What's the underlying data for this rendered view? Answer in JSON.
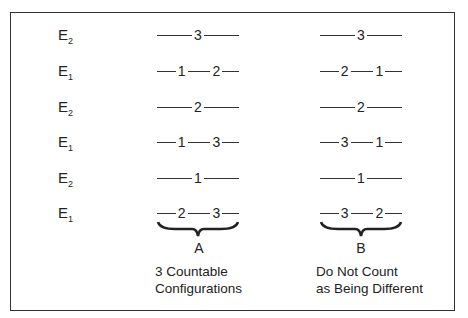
{
  "rows": [
    {
      "label": "E",
      "sub": "2",
      "a": [
        "3"
      ],
      "b": [
        "3"
      ]
    },
    {
      "label": "E",
      "sub": "1",
      "a": [
        "1",
        "2"
      ],
      "b": [
        "2",
        "1"
      ]
    },
    {
      "label": "E",
      "sub": "2",
      "a": [
        "2"
      ],
      "b": [
        "2"
      ]
    },
    {
      "label": "E",
      "sub": "1",
      "a": [
        "1",
        "3"
      ],
      "b": [
        "3",
        "1"
      ]
    },
    {
      "label": "E",
      "sub": "2",
      "a": [
        "1"
      ],
      "b": [
        "1"
      ]
    },
    {
      "label": "E",
      "sub": "1",
      "a": [
        "2",
        "3"
      ],
      "b": [
        "3",
        "2"
      ]
    }
  ],
  "columns": {
    "a": {
      "letter": "A",
      "caption_line1": "3 Countable",
      "caption_line2": "Configurations"
    },
    "b": {
      "letter": "B",
      "caption_line1": "Do Not Count",
      "caption_line2": "as Being Different"
    }
  },
  "colors": {
    "ink": "#222222",
    "line": "#333333",
    "background": "#ffffff"
  }
}
